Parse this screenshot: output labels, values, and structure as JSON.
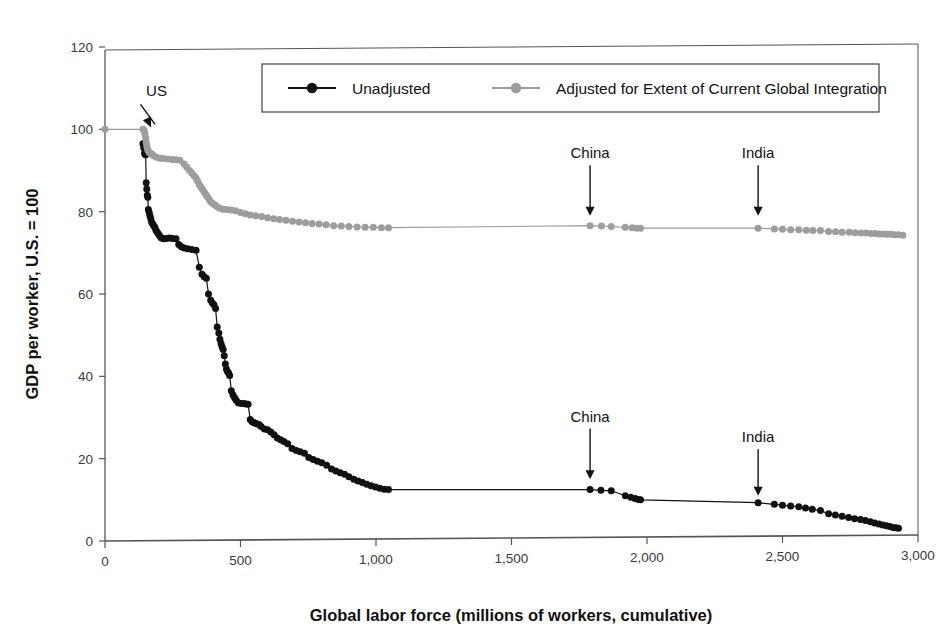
{
  "chart_data": {
    "type": "line",
    "title": "",
    "xlabel": "Global labor force (millions of workers, cumulative)",
    "ylabel": "GDP per worker, U.S. = 100",
    "xlim": [
      0,
      3000
    ],
    "ylim": [
      0,
      120
    ],
    "xticks": [
      0,
      500,
      1000,
      1500,
      2000,
      2500,
      3000
    ],
    "xtick_labels": [
      "0",
      "500",
      "1,000",
      "1,500",
      "2,000",
      "2,500",
      "3,000"
    ],
    "yticks": [
      0,
      20,
      40,
      60,
      80,
      100,
      120
    ],
    "ytick_labels": [
      "0",
      "20",
      "40",
      "60",
      "80",
      "100",
      "120"
    ],
    "grid": false,
    "legend_position": "top-center",
    "series": [
      {
        "name": "Unadjusted",
        "color": "#111111",
        "marker": "circle",
        "points": [
          [
            140,
            96.5
          ],
          [
            143,
            95.5
          ],
          [
            146,
            94.2
          ],
          [
            148,
            94.0
          ],
          [
            150,
            93.8
          ],
          [
            152,
            87.0
          ],
          [
            154,
            85.5
          ],
          [
            156,
            84.0
          ],
          [
            158,
            83.5
          ],
          [
            160,
            80.5
          ],
          [
            163,
            79.8
          ],
          [
            166,
            79.0
          ],
          [
            169,
            78.3
          ],
          [
            172,
            77.5
          ],
          [
            176,
            77.0
          ],
          [
            180,
            76.6
          ],
          [
            184,
            76.2
          ],
          [
            188,
            75.5
          ],
          [
            193,
            75.0
          ],
          [
            198,
            74.5
          ],
          [
            203,
            74.0
          ],
          [
            208,
            73.6
          ],
          [
            216,
            73.4
          ],
          [
            226,
            73.5
          ],
          [
            238,
            73.6
          ],
          [
            250,
            73.5
          ],
          [
            262,
            73.4
          ],
          [
            272,
            72.0
          ],
          [
            282,
            71.5
          ],
          [
            292,
            71.2
          ],
          [
            305,
            71.0
          ],
          [
            320,
            70.8
          ],
          [
            336,
            70.6
          ],
          [
            348,
            66.5
          ],
          [
            358,
            64.8
          ],
          [
            366,
            64.2
          ],
          [
            374,
            63.8
          ],
          [
            382,
            60.0
          ],
          [
            390,
            58.5
          ],
          [
            396,
            57.8
          ],
          [
            402,
            57.4
          ],
          [
            408,
            56.5
          ],
          [
            414,
            52.0
          ],
          [
            420,
            50.5
          ],
          [
            424,
            49.0
          ],
          [
            428,
            48.0
          ],
          [
            432,
            47.2
          ],
          [
            436,
            46.5
          ],
          [
            440,
            45.0
          ],
          [
            444,
            43.0
          ],
          [
            448,
            41.8
          ],
          [
            452,
            41.2
          ],
          [
            456,
            40.8
          ],
          [
            460,
            40.2
          ],
          [
            466,
            36.5
          ],
          [
            472,
            35.5
          ],
          [
            478,
            34.8
          ],
          [
            484,
            34.2
          ],
          [
            492,
            33.6
          ],
          [
            502,
            33.4
          ],
          [
            512,
            33.4
          ],
          [
            520,
            33.3
          ],
          [
            528,
            33.2
          ],
          [
            536,
            29.5
          ],
          [
            542,
            29.0
          ],
          [
            548,
            28.8
          ],
          [
            554,
            28.6
          ],
          [
            560,
            28.5
          ],
          [
            568,
            28.3
          ],
          [
            576,
            27.8
          ],
          [
            588,
            27.2
          ],
          [
            600,
            27.0
          ],
          [
            612,
            26.5
          ],
          [
            624,
            25.8
          ],
          [
            636,
            25.0
          ],
          [
            648,
            24.6
          ],
          [
            660,
            24.2
          ],
          [
            674,
            23.6
          ],
          [
            690,
            22.5
          ],
          [
            706,
            22.0
          ],
          [
            720,
            21.7
          ],
          [
            736,
            21.3
          ],
          [
            752,
            20.3
          ],
          [
            768,
            19.8
          ],
          [
            784,
            19.4
          ],
          [
            800,
            19.0
          ],
          [
            818,
            18.4
          ],
          [
            836,
            17.5
          ],
          [
            852,
            17.0
          ],
          [
            868,
            16.6
          ],
          [
            884,
            16.2
          ],
          [
            900,
            15.6
          ],
          [
            918,
            15.0
          ],
          [
            934,
            14.6
          ],
          [
            950,
            14.2
          ],
          [
            966,
            13.8
          ],
          [
            982,
            13.4
          ],
          [
            998,
            13.1
          ],
          [
            1014,
            12.8
          ],
          [
            1030,
            12.6
          ],
          [
            1046,
            12.5
          ],
          [
            1790,
            12.5
          ],
          [
            1830,
            12.3
          ],
          [
            1868,
            12.2
          ],
          [
            1920,
            11.0
          ],
          [
            1940,
            10.6
          ],
          [
            1956,
            10.3
          ],
          [
            1968,
            10.1
          ],
          [
            1976,
            10.0
          ],
          [
            2410,
            9.3
          ],
          [
            2470,
            8.9
          ],
          [
            2500,
            8.7
          ],
          [
            2530,
            8.5
          ],
          [
            2560,
            8.3
          ],
          [
            2585,
            8.0
          ],
          [
            2610,
            7.7
          ],
          [
            2640,
            7.4
          ],
          [
            2670,
            6.6
          ],
          [
            2695,
            6.3
          ],
          [
            2720,
            6.0
          ],
          [
            2744,
            5.7
          ],
          [
            2766,
            5.4
          ],
          [
            2788,
            5.2
          ],
          [
            2806,
            5.0
          ],
          [
            2824,
            4.7
          ],
          [
            2840,
            4.4
          ],
          [
            2856,
            4.1
          ],
          [
            2870,
            3.9
          ],
          [
            2884,
            3.7
          ],
          [
            2896,
            3.5
          ],
          [
            2908,
            3.3
          ],
          [
            2918,
            3.2
          ],
          [
            2928,
            3.1
          ]
        ]
      },
      {
        "name": "Adjusted for Extent of Current Global Integration",
        "color": "#9d9d9d",
        "marker": "circle",
        "points": [
          [
            0,
            100.0
          ],
          [
            140,
            100.0
          ],
          [
            144,
            99.8
          ],
          [
            147,
            99.0
          ],
          [
            150,
            98.0
          ],
          [
            152,
            96.8
          ],
          [
            154,
            96.0
          ],
          [
            156,
            95.4
          ],
          [
            158,
            95.0
          ],
          [
            162,
            94.5
          ],
          [
            167,
            94.2
          ],
          [
            173,
            94.0
          ],
          [
            180,
            93.6
          ],
          [
            190,
            93.2
          ],
          [
            202,
            93.0
          ],
          [
            216,
            92.9
          ],
          [
            232,
            92.8
          ],
          [
            248,
            92.7
          ],
          [
            262,
            92.6
          ],
          [
            276,
            92.5
          ],
          [
            292,
            91.6
          ],
          [
            302,
            90.8
          ],
          [
            312,
            90.0
          ],
          [
            320,
            89.4
          ],
          [
            328,
            88.8
          ],
          [
            336,
            88.2
          ],
          [
            342,
            87.4
          ],
          [
            348,
            86.6
          ],
          [
            354,
            86.0
          ],
          [
            360,
            85.4
          ],
          [
            366,
            84.8
          ],
          [
            372,
            84.2
          ],
          [
            378,
            83.6
          ],
          [
            384,
            83.0
          ],
          [
            390,
            82.4
          ],
          [
            398,
            82.0
          ],
          [
            406,
            81.6
          ],
          [
            414,
            81.2
          ],
          [
            424,
            80.8
          ],
          [
            436,
            80.6
          ],
          [
            450,
            80.5
          ],
          [
            466,
            80.4
          ],
          [
            482,
            80.2
          ],
          [
            500,
            79.8
          ],
          [
            518,
            79.5
          ],
          [
            536,
            79.2
          ],
          [
            556,
            79.0
          ],
          [
            578,
            78.8
          ],
          [
            600,
            78.5
          ],
          [
            622,
            78.3
          ],
          [
            644,
            78.1
          ],
          [
            668,
            77.9
          ],
          [
            692,
            77.7
          ],
          [
            716,
            77.5
          ],
          [
            740,
            77.3
          ],
          [
            764,
            77.1
          ],
          [
            790,
            77.0
          ],
          [
            816,
            76.8
          ],
          [
            844,
            76.6
          ],
          [
            872,
            76.5
          ],
          [
            900,
            76.4
          ],
          [
            930,
            76.3
          ],
          [
            960,
            76.2
          ],
          [
            990,
            76.2
          ],
          [
            1020,
            76.1
          ],
          [
            1046,
            76.1
          ],
          [
            1790,
            76.6
          ],
          [
            1832,
            76.5
          ],
          [
            1868,
            76.4
          ],
          [
            1920,
            76.2
          ],
          [
            1945,
            76.1
          ],
          [
            1962,
            76.0
          ],
          [
            1976,
            76.0
          ],
          [
            2410,
            76.0
          ],
          [
            2470,
            75.8
          ],
          [
            2500,
            75.7
          ],
          [
            2530,
            75.6
          ],
          [
            2560,
            75.6
          ],
          [
            2588,
            75.5
          ],
          [
            2612,
            75.4
          ],
          [
            2640,
            75.4
          ],
          [
            2670,
            75.2
          ],
          [
            2696,
            75.1
          ],
          [
            2720,
            75.0
          ],
          [
            2746,
            75.0
          ],
          [
            2768,
            74.9
          ],
          [
            2790,
            74.8
          ],
          [
            2808,
            74.8
          ],
          [
            2826,
            74.7
          ],
          [
            2842,
            74.7
          ],
          [
            2858,
            74.6
          ],
          [
            2872,
            74.6
          ],
          [
            2886,
            74.5
          ],
          [
            2900,
            74.5
          ],
          [
            2914,
            74.4
          ],
          [
            2928,
            74.4
          ],
          [
            2944,
            74.3
          ]
        ]
      }
    ],
    "annotations": [
      {
        "text": "US",
        "x": 190,
        "y": 108,
        "target_x": 148,
        "target_y": 99,
        "arrow": "diagonal"
      },
      {
        "text": "China",
        "x": 1790,
        "y": 93,
        "target_x": 1790,
        "target_y": 79,
        "arrow": "down"
      },
      {
        "text": "India",
        "x": 2410,
        "y": 93,
        "target_x": 2410,
        "target_y": 79,
        "arrow": "down"
      },
      {
        "text": "China",
        "x": 1790,
        "y": 29,
        "target_x": 1790,
        "target_y": 15,
        "arrow": "down"
      },
      {
        "text": "India",
        "x": 2410,
        "y": 24,
        "target_x": 2410,
        "target_y": 11,
        "arrow": "down"
      }
    ]
  },
  "legend": {
    "entries": [
      {
        "label": "Unadjusted",
        "color": "#111111"
      },
      {
        "label": "Adjusted for Extent of Current Global Integration",
        "color": "#9d9d9d"
      }
    ]
  }
}
